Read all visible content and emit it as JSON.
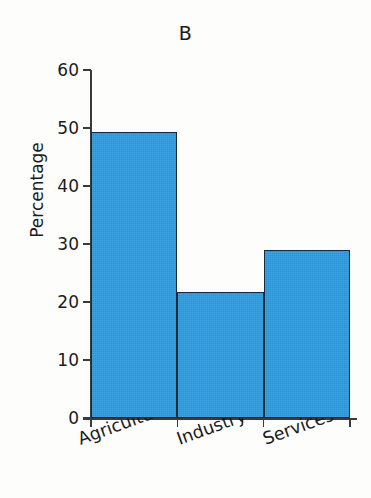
{
  "chart_data": {
    "type": "bar",
    "title": "B",
    "xlabel": "",
    "ylabel": "Percentage",
    "categories": [
      "Agriculture",
      "Industry",
      "Services"
    ],
    "values": [
      49.3,
      21.8,
      29.0
    ],
    "ylim": [
      0,
      60
    ],
    "yticks": [
      0,
      10,
      20,
      30,
      40,
      50,
      60
    ],
    "ytick_labels": [
      "0",
      "10",
      "20",
      "30",
      "40",
      "50",
      "60"
    ],
    "grid": false,
    "legend": false,
    "bar_color": "#2d9bdd",
    "bar_edge_color": "#15293f",
    "axis_color": "#3a3a3a",
    "text_color": "#1b1b1b",
    "xtick_label_rotation_deg": -20,
    "bars_adjacent": true
  }
}
